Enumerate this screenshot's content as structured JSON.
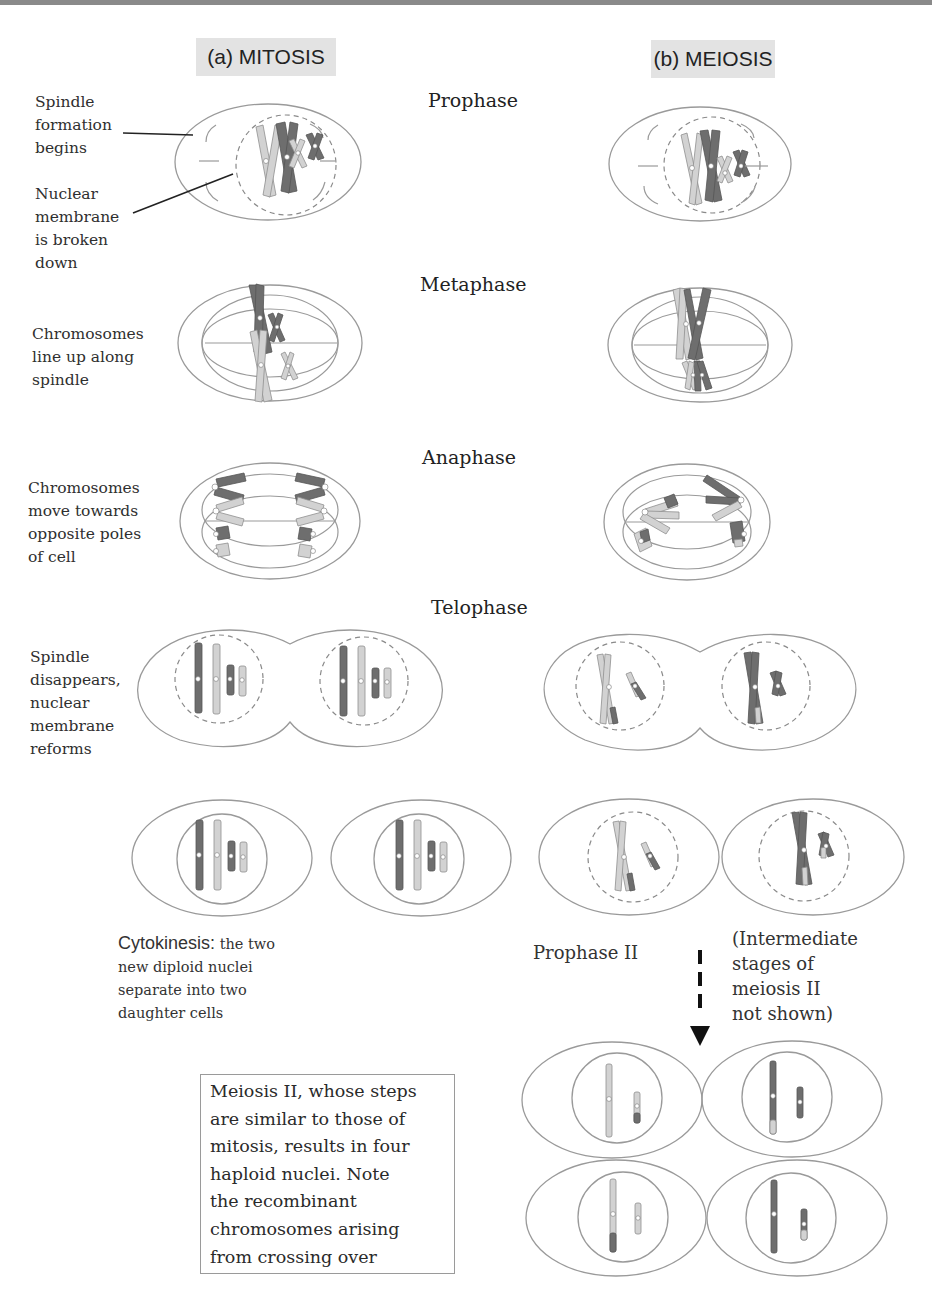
{
  "headers": {
    "mitosis": "(a) MITOSIS",
    "meiosis": "(b) MEIOSIS"
  },
  "stages": {
    "prophase": "Prophase",
    "metaphase": "Metaphase",
    "anaphase": "Anaphase",
    "telophase": "Telophase",
    "prophase_ii": "Prophase II"
  },
  "annotations": {
    "spindle_formation": [
      "Spindle",
      "formation",
      "begins"
    ],
    "nuclear_membrane": [
      "Nuclear",
      "membrane",
      "is broken",
      "down"
    ],
    "chromosomes_line_up": [
      "Chromosomes",
      "line up along",
      "spindle"
    ],
    "chromosomes_move": [
      "Chromosomes",
      "move towards",
      "opposite poles",
      "of cell"
    ],
    "spindle_disappears": [
      "Spindle",
      "disappears,",
      "nuclear",
      "membrane",
      "reforms"
    ]
  },
  "cytokinesis": {
    "lead": "Cytokinesis:",
    "lines": [
      " the two",
      "new diploid nuclei",
      "separate into two",
      "daughter cells"
    ]
  },
  "intermediate_note": [
    "(Intermediate",
    "stages of",
    "meiosis II",
    "not shown)"
  ],
  "note_box": [
    "Meiosis II, whose steps",
    "are similar to those of",
    "mitosis, results in four",
    "haploid nuclei. Note",
    "the recombinant",
    "chromosomes arising",
    "from crossing over"
  ],
  "colors": {
    "dark_chromosome": "#6e6e6e",
    "light_chromosome": "#d2d2d2",
    "outline": "#9a9a9a",
    "header_bg": "#e3e3e3",
    "top_bar": "#8a8a8a",
    "arrow": "#111111"
  }
}
